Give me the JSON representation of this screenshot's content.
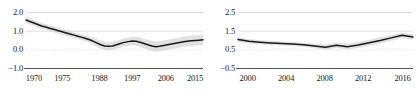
{
  "chart_data": [
    {
      "type": "line",
      "title": "",
      "xlabel": "",
      "ylabel": "",
      "panel": "left",
      "grid": true,
      "legend": null,
      "xlim": [
        1970,
        2015
      ],
      "ylim": [
        -1.0,
        2.0
      ],
      "ytick_labels": [
        "2.0",
        "1.0",
        "0.0",
        "-1.0"
      ],
      "ytick_values": [
        2.0,
        1.0,
        0.0,
        -1.0
      ],
      "xtick_labels": [
        "1970",
        "1975",
        "1988",
        "1997",
        "2006",
        "2015"
      ],
      "xtick_values": [
        1970,
        1975,
        1988,
        1997,
        2006,
        2015
      ],
      "band": {
        "name": "confidence-band",
        "color": "#c9c9c9",
        "upper": [
          1.78,
          1.7,
          1.6,
          1.52,
          1.44,
          1.38,
          1.32,
          1.26,
          1.2,
          1.14,
          1.08,
          1.02,
          0.96,
          0.9,
          0.84,
          0.78,
          0.72,
          0.66,
          0.58,
          0.48,
          0.42,
          0.4,
          0.42,
          0.48,
          0.56,
          0.62,
          0.66,
          0.7,
          0.7,
          0.66,
          0.6,
          0.54,
          0.48,
          0.44,
          0.46,
          0.5,
          0.54,
          0.58,
          0.62,
          0.66,
          0.7,
          0.74,
          0.76,
          0.78,
          0.8,
          0.82
        ],
        "lower": [
          1.42,
          1.36,
          1.28,
          1.2,
          1.12,
          1.06,
          1.0,
          0.94,
          0.88,
          0.82,
          0.76,
          0.7,
          0.64,
          0.58,
          0.52,
          0.46,
          0.38,
          0.28,
          0.16,
          0.06,
          0.0,
          -0.02,
          0.0,
          0.06,
          0.12,
          0.18,
          0.22,
          0.24,
          0.22,
          0.16,
          0.08,
          0.0,
          -0.06,
          -0.1,
          -0.08,
          -0.04,
          0.0,
          0.04,
          0.08,
          0.12,
          0.16,
          0.18,
          0.2,
          0.22,
          0.24,
          0.26
        ]
      },
      "series": [
        {
          "name": "estimate",
          "color": "#1a1a1a",
          "x": [
            1970,
            1971,
            1972,
            1973,
            1974,
            1975,
            1976,
            1977,
            1978,
            1979,
            1980,
            1981,
            1982,
            1983,
            1984,
            1985,
            1986,
            1987,
            1988,
            1989,
            1990,
            1991,
            1992,
            1993,
            1994,
            1995,
            1996,
            1997,
            1998,
            1999,
            2000,
            2001,
            2002,
            2003,
            2004,
            2005,
            2006,
            2007,
            2008,
            2009,
            2010,
            2011,
            2012,
            2013,
            2014,
            2015
          ],
          "values": [
            1.6,
            1.52,
            1.44,
            1.36,
            1.28,
            1.22,
            1.16,
            1.1,
            1.04,
            0.98,
            0.92,
            0.86,
            0.8,
            0.74,
            0.68,
            0.62,
            0.55,
            0.47,
            0.37,
            0.27,
            0.21,
            0.19,
            0.21,
            0.27,
            0.34,
            0.4,
            0.44,
            0.47,
            0.46,
            0.41,
            0.34,
            0.27,
            0.21,
            0.17,
            0.19,
            0.23,
            0.27,
            0.31,
            0.35,
            0.39,
            0.43,
            0.46,
            0.48,
            0.5,
            0.52,
            0.54
          ]
        }
      ]
    },
    {
      "type": "line",
      "title": "",
      "xlabel": "",
      "ylabel": "",
      "panel": "right",
      "grid": true,
      "legend": null,
      "xlim": [
        2000,
        2016
      ],
      "ylim": [
        -0.5,
        2.5
      ],
      "ytick_labels": [
        "2.5",
        "1.5",
        "0.5",
        "-0.5"
      ],
      "ytick_values": [
        2.5,
        1.5,
        0.5,
        -0.5
      ],
      "xtick_labels": [
        "2000",
        "2004",
        "2008",
        "2012",
        "2016"
      ],
      "xtick_values": [
        2000,
        2004,
        2008,
        2012,
        2016
      ],
      "band": {
        "name": "confidence-band",
        "color": "#c9c9c9",
        "upper": [
          1.18,
          1.08,
          1.02,
          0.98,
          0.95,
          0.92,
          0.88,
          0.82,
          0.78,
          0.88,
          0.82,
          0.92,
          1.04,
          1.16,
          1.3,
          1.42,
          1.34
        ],
        "lower": [
          0.92,
          0.84,
          0.8,
          0.76,
          0.73,
          0.7,
          0.66,
          0.58,
          0.5,
          0.6,
          0.52,
          0.6,
          0.72,
          0.84,
          0.98,
          1.14,
          1.04
        ]
      },
      "series": [
        {
          "name": "estimate",
          "color": "#1a1a1a",
          "x": [
            2000,
            2001,
            2002,
            2003,
            2004,
            2005,
            2006,
            2007,
            2008,
            2009,
            2010,
            2011,
            2012,
            2013,
            2014,
            2015,
            2016
          ],
          "values": [
            1.05,
            0.96,
            0.91,
            0.87,
            0.84,
            0.81,
            0.77,
            0.7,
            0.64,
            0.74,
            0.67,
            0.76,
            0.88,
            1.0,
            1.14,
            1.28,
            1.19
          ]
        }
      ]
    }
  ],
  "panels": [
    {
      "name": "left-panel",
      "y_labels": [
        "2.0",
        "1.0",
        "0.0",
        "-1.0"
      ],
      "x_labels": [
        "1970",
        "1975",
        "1988",
        "1997",
        "2006",
        "2015"
      ]
    },
    {
      "name": "right-panel",
      "y_labels": [
        "2.5",
        "1.5",
        "0.5",
        "-0.5"
      ],
      "x_labels": [
        "2000",
        "2004",
        "2008",
        "2012",
        "2016"
      ]
    }
  ],
  "colors": {
    "line": "#1a1a1a",
    "band": "#c9c9c9",
    "grid": "#d8d8d8",
    "axis": "#555555",
    "text": "#1a1a1a",
    "background": "#ffffff"
  }
}
